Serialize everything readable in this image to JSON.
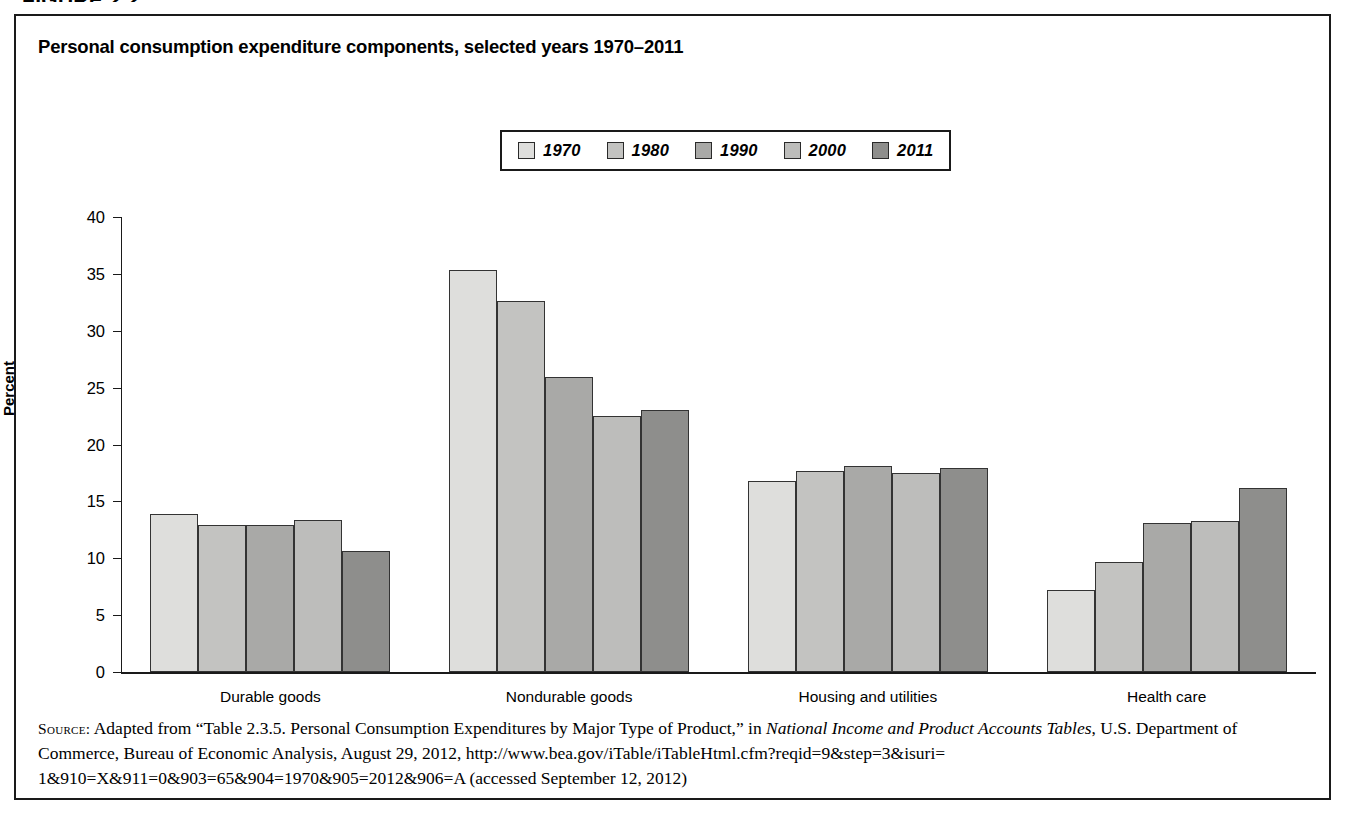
{
  "figure": {
    "header": "FIGURE 2.2",
    "title": "Personal consumption expenditure components, selected years 1970–2011"
  },
  "legend": {
    "position": "top-center",
    "items": [
      {
        "label": "1970",
        "color": "#dededc"
      },
      {
        "label": "1980",
        "color": "#c3c3c1"
      },
      {
        "label": "1990",
        "color": "#a9a9a7"
      },
      {
        "label": "2000",
        "color": "#bdbdbb"
      },
      {
        "label": "2011",
        "color": "#8e8e8c"
      }
    ]
  },
  "axes": {
    "ylabel": "Percent",
    "yticks": [
      "0",
      "5",
      "10",
      "15",
      "20",
      "25",
      "30",
      "35",
      "40"
    ],
    "xticklabels": [
      "Durable goods",
      "Nondurable goods",
      "Housing and utilities",
      "Health care"
    ]
  },
  "source": {
    "label": "Source:",
    "line1_a": " Adapted from “Table 2.3.5. Personal Consumption Expenditures by Major Type of Product,” in ",
    "line1_italic": "National Income and Product Accounts Tables",
    "line1_b": ",",
    "line2": "U.S. Department of Commerce, Bureau of Economic Analysis, August 29, 2012, http://www.bea.gov/iTable/iTableHtml.cfm?reqid=9&step=3&isuri=",
    "line3": "1&910=X&911=0&903=65&904=1970&905=2012&906=A (accessed September 12, 2012)"
  },
  "chart_data": {
    "type": "bar",
    "title": "Personal consumption expenditure components, selected years 1970–2011",
    "xlabel": "",
    "ylabel": "Percent",
    "ylim": [
      0,
      40
    ],
    "ytick_step": 5,
    "grid": false,
    "legend_position": "top-center",
    "categories": [
      "Durable goods",
      "Nondurable goods",
      "Housing and utilities",
      "Health care"
    ],
    "series": [
      {
        "name": "1970",
        "color": "#dededc",
        "values": [
          13.9,
          35.3,
          16.8,
          7.2
        ]
      },
      {
        "name": "1980",
        "color": "#c3c3c1",
        "values": [
          12.9,
          32.6,
          17.7,
          9.7
        ]
      },
      {
        "name": "1990",
        "color": "#a9a9a7",
        "values": [
          12.9,
          25.9,
          18.1,
          13.1
        ]
      },
      {
        "name": "2000",
        "color": "#bdbdbb",
        "values": [
          13.4,
          22.5,
          17.5,
          13.3
        ]
      },
      {
        "name": "2011",
        "color": "#8e8e8c",
        "values": [
          10.6,
          23.0,
          17.9,
          16.2
        ]
      }
    ]
  }
}
